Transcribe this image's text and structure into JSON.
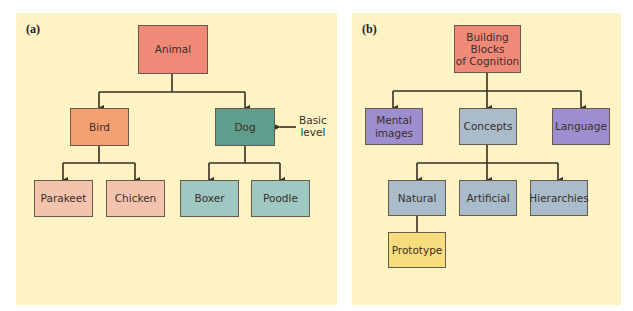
{
  "colors": {
    "panel_bg": "#fdf3c4",
    "root": "#f08a78",
    "bird": "#f4a070",
    "bird_children": "#f4c3ad",
    "dog": "#5e9e8c",
    "dog_children": "#9ec8c1",
    "purple": "#9d8ed0",
    "blue_gray": "#a9bccb",
    "yellow": "#f7dd7c",
    "line": "#3a2e22"
  },
  "panels": [
    {
      "label": "(a)",
      "nodes": {
        "animal": "Animal",
        "bird": "Bird",
        "dog": "Dog",
        "parakeet": "Parakeet",
        "chicken": "Chicken",
        "boxer": "Boxer",
        "poodle": "Poodle"
      },
      "annotation": {
        "line1": "Basic",
        "line2": "level"
      }
    },
    {
      "label": "(b)",
      "nodes": {
        "root_line1": "Building",
        "root_line2": "Blocks",
        "root_line3": "of Cognition",
        "mental_line1": "Mental",
        "mental_line2": "images",
        "concepts": "Concepts",
        "language": "Language",
        "natural": "Natural",
        "artificial": "Artificial",
        "hierarchies": "Hierarchies",
        "prototype": "Prototype"
      }
    }
  ]
}
